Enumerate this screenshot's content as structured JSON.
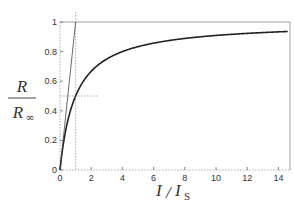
{
  "chart_data": {
    "type": "line",
    "title": "",
    "xlabel": "I / I_S",
    "ylabel": "R / R_∞",
    "xlim": [
      0,
      15
    ],
    "ylim": [
      0,
      1
    ],
    "xticks": [
      "0",
      "2",
      "4",
      "6",
      "8",
      "10",
      "12",
      "14"
    ],
    "yticks": [
      "0",
      "0.2",
      "0.4",
      "0.6",
      "0.8",
      "1"
    ],
    "grid": false,
    "series": [
      {
        "name": "R/R_∞ = (I/I_S)/(1+I/I_S)",
        "style": "solid-thick",
        "x": [
          0,
          0.25,
          0.5,
          1,
          1.5,
          2,
          3,
          4,
          5,
          6,
          8,
          10,
          12,
          14,
          15
        ],
        "y": [
          0,
          0.2,
          0.333,
          0.5,
          0.6,
          0.667,
          0.75,
          0.8,
          0.833,
          0.857,
          0.889,
          0.909,
          0.923,
          0.933,
          0.9375
        ]
      },
      {
        "name": "initial slope tangent",
        "style": "solid-thin",
        "x": [
          0,
          1
        ],
        "y": [
          0,
          1
        ]
      },
      {
        "name": "saturation asymptote",
        "style": "solid-thin",
        "x": [
          0,
          15
        ],
        "y": [
          1,
          1
        ]
      }
    ],
    "annotations": [
      {
        "type": "vline-dashed",
        "x": 1
      },
      {
        "type": "hline-dashed",
        "y": 0.5,
        "x_range": [
          0,
          2.5
        ]
      }
    ]
  },
  "labels": {
    "y_num": "R",
    "y_den": "R",
    "y_den_sub": "∞",
    "x_main": "I",
    "x_slash": "/",
    "x_den": "I",
    "x_den_sub": "S"
  }
}
